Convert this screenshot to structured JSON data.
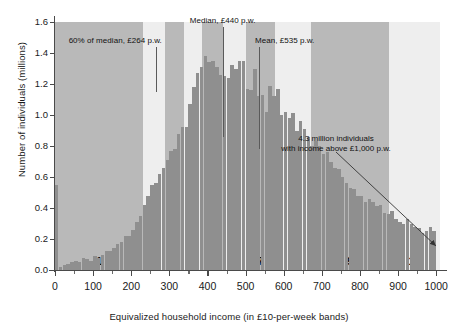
{
  "chart_data": {
    "type": "bar",
    "title": "",
    "xlabel": "Equivalized household income (in £10-per-week bands)",
    "ylabel": "Number of individuals (millions)",
    "xlim": [
      0,
      1010
    ],
    "ylim": [
      0,
      1.6
    ],
    "grid": true,
    "legend": "none",
    "bin_width": 10,
    "x_tick_labels": [
      "0",
      "100",
      "200",
      "300",
      "400",
      "500",
      "600",
      "700",
      "800",
      "900",
      "1000"
    ],
    "x_tick_values": [
      0,
      100,
      200,
      300,
      400,
      500,
      600,
      700,
      800,
      900,
      1000
    ],
    "y_tick_labels": [
      "0.0",
      "0.2",
      "0.4",
      "0.6",
      "0.8",
      "1.0",
      "1.2",
      "1.4",
      "1.6"
    ],
    "y_tick_values": [
      0.0,
      0.2,
      0.4,
      0.6,
      0.8,
      1.0,
      1.2,
      1.4,
      1.6
    ],
    "bin_starts": [
      0,
      10,
      20,
      30,
      40,
      50,
      60,
      70,
      80,
      90,
      100,
      110,
      120,
      130,
      140,
      150,
      160,
      170,
      180,
      190,
      200,
      210,
      220,
      230,
      240,
      250,
      260,
      270,
      280,
      290,
      300,
      310,
      320,
      330,
      340,
      350,
      360,
      370,
      380,
      390,
      400,
      410,
      420,
      430,
      440,
      450,
      460,
      470,
      480,
      490,
      500,
      510,
      520,
      530,
      540,
      550,
      560,
      570,
      580,
      590,
      600,
      610,
      620,
      630,
      640,
      650,
      660,
      670,
      680,
      690,
      700,
      710,
      720,
      730,
      740,
      750,
      760,
      770,
      780,
      790,
      800,
      810,
      820,
      830,
      840,
      850,
      860,
      870,
      880,
      890,
      900,
      910,
      920,
      930,
      940,
      950,
      960,
      970,
      980,
      990
    ],
    "values": [
      0.55,
      0.02,
      0.03,
      0.04,
      0.05,
      0.06,
      0.05,
      0.08,
      0.07,
      0.06,
      0.09,
      0.08,
      0.1,
      0.12,
      0.12,
      0.14,
      0.17,
      0.18,
      0.22,
      0.22,
      0.26,
      0.31,
      0.35,
      0.42,
      0.48,
      0.55,
      0.56,
      0.62,
      0.66,
      0.71,
      0.77,
      0.78,
      0.88,
      0.92,
      0.92,
      1.07,
      1.18,
      1.27,
      1.31,
      1.38,
      1.34,
      1.35,
      1.31,
      1.26,
      1.25,
      1.24,
      1.32,
      1.3,
      1.35,
      1.35,
      1.17,
      1.16,
      1.3,
      1.12,
      1.13,
      1.02,
      1.19,
      1.12,
      1.17,
      1.0,
      1.02,
      0.98,
      1.01,
      0.9,
      0.96,
      0.91,
      0.86,
      0.8,
      0.83,
      0.8,
      0.75,
      0.76,
      0.7,
      0.66,
      0.65,
      0.6,
      0.56,
      0.53,
      0.52,
      0.48,
      0.48,
      0.44,
      0.46,
      0.44,
      0.41,
      0.42,
      0.37,
      0.36,
      0.38,
      0.33,
      0.31,
      0.3,
      0.33,
      0.3,
      0.28,
      0.27,
      0.24,
      0.25,
      0.28,
      0.25
    ],
    "deciles": [
      {
        "label": "1",
        "start": 0,
        "end": 232,
        "shade": "dark"
      },
      {
        "label": "2",
        "start": 232,
        "end": 288,
        "shade": "light"
      },
      {
        "label": "3",
        "start": 288,
        "end": 338,
        "shade": "dark"
      },
      {
        "label": "4",
        "start": 338,
        "end": 385,
        "shade": "light"
      },
      {
        "label": "5",
        "start": 385,
        "end": 440,
        "shade": "dark"
      },
      {
        "label": "6",
        "start": 440,
        "end": 500,
        "shade": "light"
      },
      {
        "label": "7",
        "start": 500,
        "end": 578,
        "shade": "dark"
      },
      {
        "label": "8",
        "start": 578,
        "end": 672,
        "shade": "light"
      },
      {
        "label": "9",
        "start": 672,
        "end": 876,
        "shade": "dark"
      },
      {
        "label": "10",
        "start": 876,
        "end": 1010,
        "shade": "light"
      }
    ],
    "annotations": [
      {
        "name": "sixty-percent-of-median",
        "text": "60% of median, £264 p.w.",
        "value": 264,
        "line_top_y": 1.44,
        "line_bottom_y": 1.15
      },
      {
        "name": "median",
        "text": "Median, £440 p.w.",
        "value": 440,
        "line_top_y": 1.57,
        "line_bottom_y": 0.86
      },
      {
        "name": "mean",
        "text": "Mean, £535 p.w.",
        "value": 535,
        "line_top_y": 1.44,
        "line_bottom_y": 0.78
      },
      {
        "name": "above-1000-callout",
        "text_line1": "4.3 million individuals",
        "text_line2": "with income above £1,000 p.w."
      }
    ]
  }
}
